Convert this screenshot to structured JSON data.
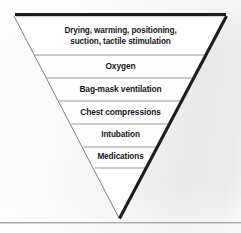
{
  "figure": {
    "shape": "inverted-triangle",
    "tiers": [
      {
        "id": "tier-drying",
        "label": "Drying, warming, positioning,\nsuction, tactile stimulation"
      },
      {
        "id": "tier-oxygen",
        "label": "Oxygen"
      },
      {
        "id": "tier-bag-mask-ventilation",
        "label": "Bag-mask ventilation"
      },
      {
        "id": "tier-chest-compressions",
        "label": "Chest compressions"
      },
      {
        "id": "tier-intubation",
        "label": "Intubation"
      },
      {
        "id": "tier-medications",
        "label": "Medications"
      }
    ],
    "colors": {
      "band_fill": "#ffffff",
      "band_divider": "#8e8e8e",
      "left_edge": "#6f6f6f",
      "right_edge": "#1c1c1c",
      "top_edge": "#1c1c1c",
      "text": "#17171a",
      "background_light": "#fdfdfd",
      "background_gray": "#e9e9e9",
      "bottom_rule": "#a9a9a9"
    },
    "geometry": {
      "apex": {
        "x": 119,
        "y": 218
      },
      "top_left": {
        "x": 14,
        "y": 16
      },
      "top_right": {
        "x": 226,
        "y": 16
      },
      "divider_y": [
        55,
        78,
        101,
        124,
        147,
        168
      ],
      "bottom_rule_y": 222
    }
  }
}
